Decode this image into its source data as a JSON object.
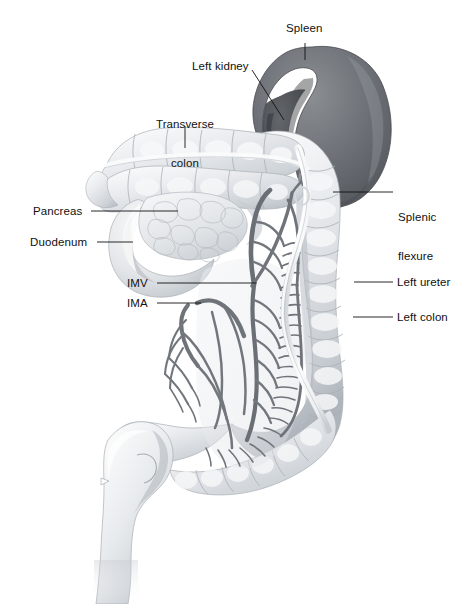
{
  "figure": {
    "title_hidden": "",
    "type": "anatomical-illustration",
    "background_color": "#ffffff",
    "ink_color": "#111111",
    "palette": {
      "spleen_dark": "#5d6064",
      "spleen_mid": "#74787c",
      "kidney_dark": "#4b4e52",
      "colon_light": "#eceef0",
      "colon_mid": "#d3d7db",
      "colon_shadow": "#b3b8bd",
      "vessel_gray": "#74797e",
      "vessel_dark": "#5e6368",
      "ureter_pale": "#f2f3f4",
      "pancreas": "#dfe2e4",
      "duodenum": "#d8dcdf",
      "outline": "#9aa0a5"
    },
    "labels": [
      {
        "id": "spleen",
        "text": "Spleen",
        "x": 286,
        "y": 27,
        "align": "left",
        "leader": "vertical-down"
      },
      {
        "id": "left-kidney",
        "text": "Left kidney",
        "x": 192,
        "y": 65,
        "align": "left",
        "leader": "diagonal-down-right"
      },
      {
        "id": "transverse-colon",
        "text": "Transverse\ncolon",
        "line1": "Transverse",
        "line2": "colon",
        "x": 148,
        "y": 96,
        "align": "center",
        "leader": "vertical-down"
      },
      {
        "id": "splenic-flexure",
        "text": "Splenic\nflexure",
        "line1": "Splenic",
        "line2": "flexure",
        "x": 398,
        "y": 187,
        "align": "left",
        "leader": "horizontal-left"
      },
      {
        "id": "pancreas",
        "text": "Pancreas",
        "x": 33,
        "y": 205,
        "align": "left",
        "leader": "horizontal-right"
      },
      {
        "id": "duodenum",
        "text": "Duodenum",
        "x": 30,
        "y": 236,
        "align": "left",
        "leader": "horizontal-right"
      },
      {
        "id": "imv",
        "text": "IMV",
        "x": 127,
        "y": 277,
        "align": "left",
        "leader": "horizontal-right"
      },
      {
        "id": "left-ureter",
        "text": "Left ureter",
        "x": 396,
        "y": 276,
        "align": "left",
        "leader": "horizontal-left"
      },
      {
        "id": "ima",
        "text": "IMA",
        "x": 127,
        "y": 297,
        "align": "left",
        "leader": "horizontal-right"
      },
      {
        "id": "left-colon",
        "text": "Left colon",
        "x": 396,
        "y": 311,
        "align": "left",
        "leader": "horizontal-left"
      }
    ]
  }
}
